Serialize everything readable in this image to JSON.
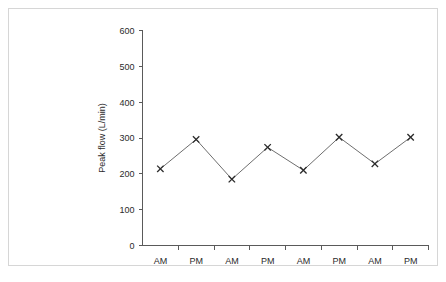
{
  "figure": {
    "frame_color": "#d6d6d6",
    "background": "#ffffff",
    "axis_color": "#5a5a5a",
    "line_color": "#6e6e6e",
    "marker_color": "#2b2b2b"
  },
  "chart_data": {
    "type": "line",
    "title": "",
    "subtitle": "",
    "xlabel": "",
    "ylabel": "Peak flow (L/min)",
    "categories": [
      "AM",
      "PM",
      "AM",
      "PM",
      "AM",
      "PM",
      "AM",
      "PM"
    ],
    "values": [
      214,
      296,
      185,
      274,
      210,
      302,
      228,
      302
    ],
    "series": [
      {
        "name": "Peak flow",
        "values": [
          214,
          296,
          185,
          274,
          210,
          302,
          228,
          302
        ]
      }
    ],
    "ylim": [
      0,
      600
    ],
    "ytick_labels": [
      "0",
      "100",
      "200",
      "300",
      "400",
      "500",
      "600"
    ],
    "ytick_values": [
      0,
      100,
      200,
      300,
      400,
      500,
      600
    ],
    "xtick_labels": [
      "AM",
      "PM",
      "AM",
      "PM",
      "AM",
      "PM",
      "AM",
      "PM"
    ],
    "grid": false,
    "legend": null,
    "marker": "x",
    "annotations": []
  }
}
